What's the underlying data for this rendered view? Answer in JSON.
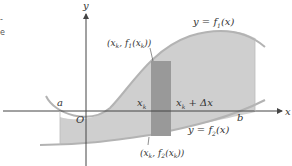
{
  "figure": {
    "axis_labels": {
      "x": "x",
      "y": "y",
      "origin": "O"
    },
    "bound_labels": {
      "a": "a",
      "b": "b"
    },
    "strip_labels": {
      "left": "x",
      "left_sub": "k",
      "right": "x",
      "right_sub": "k",
      "right_suffix": " + Δx"
    },
    "curve_labels": {
      "upper": {
        "prefix": "y = f",
        "sub": "1",
        "suffix": "(x)"
      },
      "lower": {
        "prefix": "y = f",
        "sub": "2",
        "suffix": "(x)"
      }
    },
    "point_labels": {
      "upper": {
        "t1": "(x",
        "s1": "k",
        "t2": ", f",
        "s2": "1",
        "t3": "(x",
        "s3": "k",
        "t4": "))"
      },
      "lower": {
        "t1": "(x",
        "s1": "k",
        "t2": ", f",
        "s2": "2",
        "t3": "(x",
        "s3": "k",
        "t4": "))"
      }
    },
    "colors": {
      "region": "#c9c9c9",
      "strip": "#9a9a9a",
      "curve": "#b5b5b5",
      "axis": "#444444"
    },
    "edge_fragments": [
      "-",
      "e"
    ]
  }
}
